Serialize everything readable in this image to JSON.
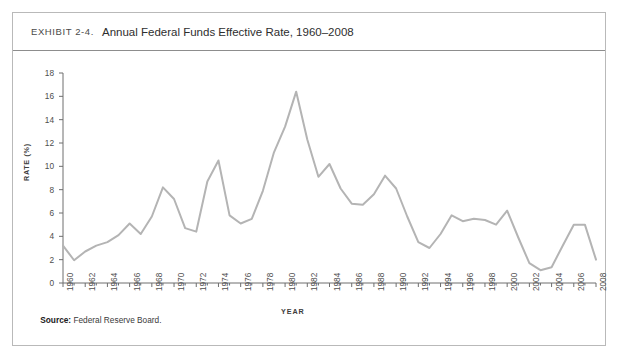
{
  "exhibit": {
    "label": "Exhibit 2-4.",
    "title": "Annual Federal Funds Effective Rate, 1960–2008",
    "source_prefix": "Source:",
    "source_text": "Federal Reserve Board."
  },
  "style": {
    "line_color": "#b4b4b4",
    "axis_color": "#6e6e6e",
    "border_color": "#b9b9b9",
    "rule_color": "#8d8d8d"
  },
  "chart_data": {
    "type": "line",
    "title": "Annual Federal Funds Effective Rate, 1960–2008",
    "xlabel": "YEAR",
    "ylabel": "RATE (%)",
    "ylim": [
      0,
      18
    ],
    "xlim": [
      1960,
      2008
    ],
    "ytick_step": 2,
    "xtick_label_step": 2,
    "grid": false,
    "legend": "none",
    "yticks": [
      0,
      2,
      4,
      6,
      8,
      10,
      12,
      14,
      16,
      18
    ],
    "xticks": [
      1960,
      1962,
      1964,
      1966,
      1968,
      1970,
      1972,
      1974,
      1976,
      1978,
      1980,
      1982,
      1984,
      1986,
      1988,
      1990,
      1992,
      1994,
      1996,
      1998,
      2000,
      2002,
      2004,
      2006,
      2008
    ],
    "series": [
      {
        "name": "Federal Funds Effective Rate",
        "x": [
          1960,
          1961,
          1962,
          1963,
          1964,
          1965,
          1966,
          1967,
          1968,
          1969,
          1970,
          1971,
          1972,
          1973,
          1974,
          1975,
          1976,
          1977,
          1978,
          1979,
          1980,
          1981,
          1982,
          1983,
          1984,
          1985,
          1986,
          1987,
          1988,
          1989,
          1990,
          1991,
          1992,
          1993,
          1994,
          1995,
          1996,
          1997,
          1998,
          1999,
          2000,
          2001,
          2002,
          2003,
          2004,
          2005,
          2006,
          2007,
          2008
        ],
        "values": [
          3.2,
          1.95,
          2.7,
          3.2,
          3.5,
          4.1,
          5.1,
          4.2,
          5.7,
          8.2,
          7.2,
          4.7,
          4.4,
          8.7,
          10.5,
          5.8,
          5.1,
          5.5,
          7.9,
          11.2,
          13.4,
          16.4,
          12.3,
          9.1,
          10.2,
          8.1,
          6.8,
          6.7,
          7.6,
          9.2,
          8.1,
          5.7,
          3.5,
          3.0,
          4.2,
          5.8,
          5.3,
          5.5,
          5.4,
          5.0,
          6.2,
          3.9,
          1.7,
          1.1,
          1.35,
          3.2,
          5.0,
          5.0,
          2.0
        ]
      }
    ]
  }
}
